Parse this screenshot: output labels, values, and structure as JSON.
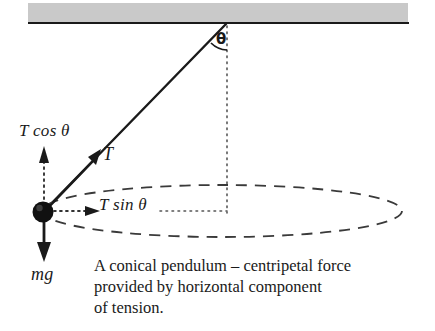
{
  "figure": {
    "background_color": "#ffffff",
    "ink_color": "#1a1a1a",
    "ceiling": {
      "name": "ceiling-support",
      "fill_color": "#c9c9c9",
      "edge_color": "#1a1a1a"
    },
    "labels": {
      "tension_vertical_component": {
        "symbol": "T",
        "operator": "cos",
        "angle": "θ",
        "full": "T cos θ"
      },
      "tension": {
        "symbol": "T",
        "full": "T"
      },
      "tension_horizontal_component": {
        "symbol": "T",
        "operator": "sin",
        "angle": "θ",
        "full": "T sin θ"
      },
      "weight": {
        "full": "mg"
      },
      "angle": {
        "full": "θ"
      }
    },
    "caption": {
      "line1": "A conical pendulum – centripetal force",
      "line2": "provided by horizontal component",
      "line3": "of tension."
    }
  }
}
